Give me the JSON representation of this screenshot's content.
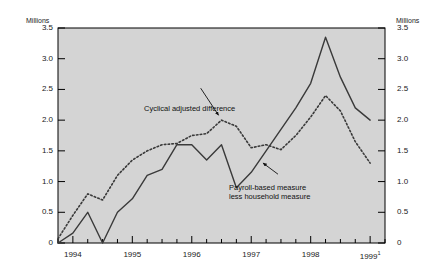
{
  "chart_data": {
    "type": "line",
    "title": "",
    "subtitle": "",
    "xlabel": "",
    "ylabel": "Millions",
    "ylabel_right": "Millions",
    "ylim": [
      0,
      3.5
    ],
    "ytick_values": [
      0,
      0.5,
      1.0,
      1.5,
      2.0,
      2.5,
      3.0,
      3.5
    ],
    "ytick_labels": [
      "0",
      "0.5",
      "1.0",
      "1.5",
      "2.0",
      "2.5",
      "3.0",
      "3.5"
    ],
    "ytick_labels_right": [
      "0",
      "0.5",
      "1.0",
      "1.5",
      "2.0",
      "2.5",
      "3.0",
      "3.5"
    ],
    "xlim": [
      1993.75,
      1999.25
    ],
    "xtick_year_labels": [
      "1994",
      "1995",
      "1996",
      "1997",
      "1998",
      "1999"
    ],
    "xtick_year_positions": [
      1994.0,
      1995.0,
      1996.0,
      1997.0,
      1998.0,
      1999.0
    ],
    "x_last_label_superscript": "1",
    "xtick_minor_step": 0.25,
    "grid": false,
    "legend_position": "inline-annotations",
    "plot_background": "#d4d4d4",
    "axis_color": "#000000",
    "x": [
      1993.75,
      1994.0,
      1994.25,
      1994.5,
      1994.75,
      1995.0,
      1995.25,
      1995.5,
      1995.75,
      1996.0,
      1996.25,
      1996.5,
      1996.75,
      1997.0,
      1997.25,
      1997.5,
      1997.75,
      1998.0,
      1998.25,
      1998.5,
      1998.75,
      1999.0
    ],
    "series": [
      {
        "name": "Payroll-based measure less household measure",
        "style": "solid",
        "color": "#3a3a3a",
        "values": [
          0.0,
          0.16,
          0.5,
          0.0,
          0.5,
          0.72,
          1.1,
          1.2,
          1.6,
          1.6,
          1.35,
          1.6,
          0.9,
          1.15,
          1.5,
          1.85,
          2.2,
          2.6,
          3.35,
          2.7,
          2.2,
          2.0
        ]
      },
      {
        "name": "Cyclical adjusted difference",
        "style": "dotted",
        "color": "#3a3a3a",
        "values": [
          0.07,
          0.45,
          0.8,
          0.7,
          1.1,
          1.35,
          1.5,
          1.6,
          1.62,
          1.75,
          1.78,
          2.0,
          1.9,
          1.55,
          1.6,
          1.52,
          1.75,
          2.05,
          2.4,
          2.15,
          1.65,
          1.3
        ]
      }
    ],
    "annotations": [
      {
        "name": "cyclical-adjusted-difference",
        "text": "Cyclical adjusted difference",
        "arrow_from": [
          1996.15,
          2.52
        ],
        "arrow_to": [
          1996.45,
          2.08
        ]
      },
      {
        "name": "payroll-less-household",
        "text_line1": "Payroll-based measure",
        "text_line2": "less household measure",
        "arrow_from": [
          1997.45,
          1.12
        ],
        "arrow_to": [
          1997.2,
          1.3
        ]
      }
    ]
  }
}
